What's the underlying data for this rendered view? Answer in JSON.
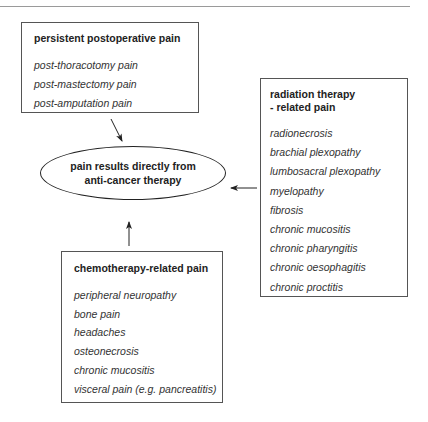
{
  "diagram": {
    "center": {
      "line1": "pain results directly from",
      "line2": "anti-cancer therapy"
    },
    "boxes": {
      "postoperative": {
        "title": "persistent postoperative pain",
        "items": [
          "post-thoracotomy pain",
          "post-mastectomy pain",
          "post-amputation pain"
        ]
      },
      "radiation": {
        "title_line1": "radiation therapy",
        "title_line2": "- related pain",
        "items": [
          "radionecrosis",
          "brachial plexopathy",
          "lumbosacral plexopathy",
          "myelopathy",
          "fibrosis",
          "chronic mucositis",
          "chronic pharyngitis",
          "chronic oesophagitis",
          "chronic proctitis"
        ]
      },
      "chemotherapy": {
        "title": "chemotherapy-related pain",
        "items": [
          "peripheral neuropathy",
          "bone pain",
          "headaches",
          "osteonecrosis",
          "chronic mucositis",
          "visceral pain (e.g. pancreatitis)"
        ]
      }
    },
    "arrows": [
      {
        "from": "postoperative",
        "to": "center"
      },
      {
        "from": "radiation",
        "to": "center"
      },
      {
        "from": "chemotherapy",
        "to": "center"
      }
    ]
  }
}
